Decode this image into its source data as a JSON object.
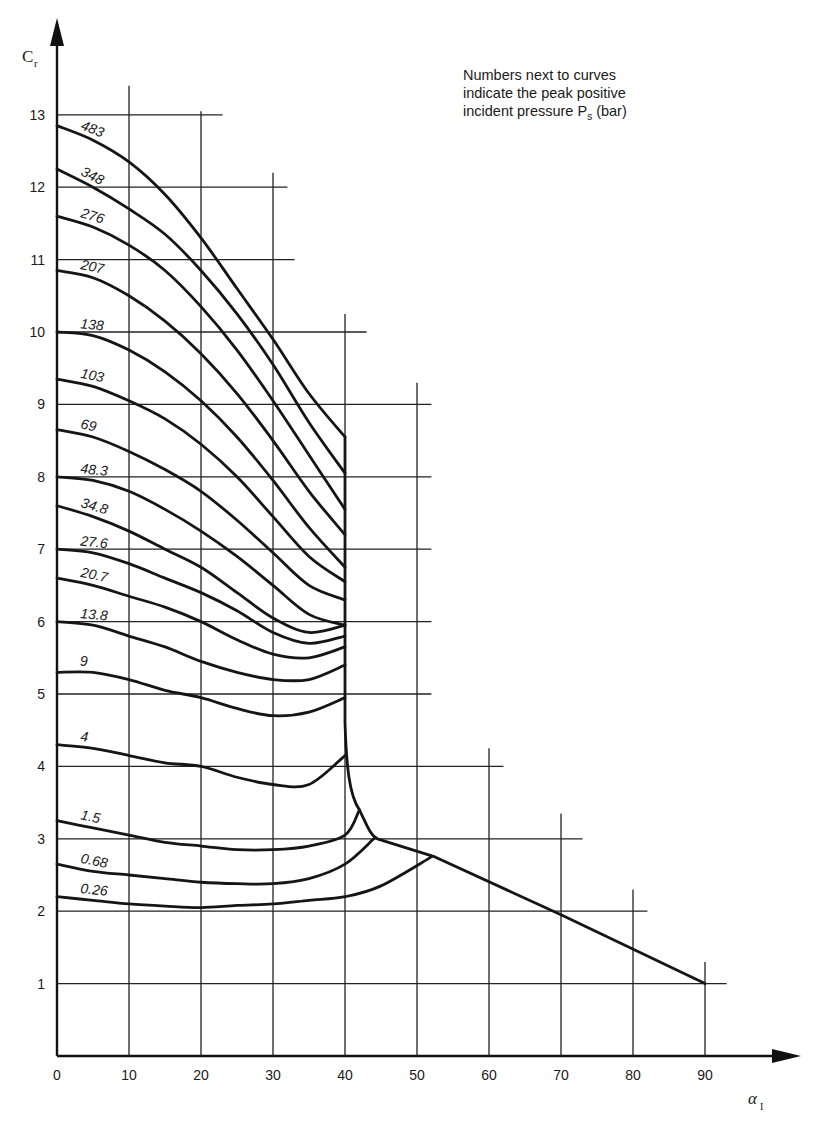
{
  "chart_data": {
    "type": "line",
    "title": "",
    "annotation": {
      "line1": "Numbers next to curves",
      "line2": "indicate the peak positive",
      "line3_prefix": "incident pressure P",
      "line3_sub": "s",
      "line3_suffix": " (bar)"
    },
    "xlabel": "α",
    "xlabel_sub": "I",
    "ylabel": "C",
    "ylabel_sub": "r",
    "xlim": [
      0,
      95
    ],
    "ylim": [
      0,
      13.6
    ],
    "x_ticks": [
      0,
      10,
      20,
      30,
      40,
      50,
      60,
      70,
      80,
      90
    ],
    "y_ticks": [
      1,
      2,
      3,
      4,
      5,
      6,
      7,
      8,
      9,
      10,
      11,
      12,
      13
    ],
    "grid": "staircase",
    "grid_extents": {
      "horizontal_right_end_x": {
        "1": 93,
        "2": 82,
        "3": 73,
        "4": 62,
        "5": 52,
        "6": 52,
        "7": 52,
        "8": 52,
        "9": 52,
        "10": 43,
        "11": 33,
        "12": 32,
        "13": 23
      },
      "vertical_top_y": {
        "10": 13.4,
        "20": 13.05,
        "30": 12.2,
        "40": 10.25,
        "50": 9.3,
        "60": 4.25,
        "70": 3.35,
        "80": 2.3,
        "90": 1.3
      }
    },
    "series": [
      {
        "name": "483",
        "points": [
          [
            0,
            12.85
          ],
          [
            5,
            12.65
          ],
          [
            10,
            12.35
          ],
          [
            15,
            11.9
          ],
          [
            20,
            11.3
          ],
          [
            25,
            10.6
          ],
          [
            30,
            9.9
          ],
          [
            35,
            9.15
          ],
          [
            40,
            8.55
          ]
        ]
      },
      {
        "name": "348",
        "points": [
          [
            0,
            12.25
          ],
          [
            5,
            12.0
          ],
          [
            10,
            11.7
          ],
          [
            15,
            11.35
          ],
          [
            20,
            10.85
          ],
          [
            25,
            10.25
          ],
          [
            30,
            9.55
          ],
          [
            35,
            8.75
          ],
          [
            40,
            8.05
          ]
        ]
      },
      {
        "name": "276",
        "points": [
          [
            0,
            11.6
          ],
          [
            5,
            11.45
          ],
          [
            10,
            11.2
          ],
          [
            15,
            10.85
          ],
          [
            20,
            10.35
          ],
          [
            25,
            9.75
          ],
          [
            30,
            9.05
          ],
          [
            35,
            8.3
          ],
          [
            40,
            7.55
          ]
        ]
      },
      {
        "name": "207",
        "points": [
          [
            0,
            10.85
          ],
          [
            5,
            10.75
          ],
          [
            10,
            10.5
          ],
          [
            15,
            10.15
          ],
          [
            20,
            9.7
          ],
          [
            25,
            9.15
          ],
          [
            30,
            8.5
          ],
          [
            35,
            7.8
          ],
          [
            40,
            7.2
          ]
        ]
      },
      {
        "name": "138",
        "points": [
          [
            0,
            10.0
          ],
          [
            5,
            9.95
          ],
          [
            10,
            9.75
          ],
          [
            15,
            9.45
          ],
          [
            20,
            9.05
          ],
          [
            25,
            8.55
          ],
          [
            30,
            7.95
          ],
          [
            35,
            7.3
          ],
          [
            40,
            6.75
          ]
        ]
      },
      {
        "name": "103",
        "points": [
          [
            0,
            9.35
          ],
          [
            5,
            9.25
          ],
          [
            10,
            9.05
          ],
          [
            15,
            8.8
          ],
          [
            20,
            8.45
          ],
          [
            25,
            8.0
          ],
          [
            30,
            7.45
          ],
          [
            35,
            6.9
          ],
          [
            40,
            6.55
          ]
        ]
      },
      {
        "name": "69",
        "points": [
          [
            0,
            8.65
          ],
          [
            5,
            8.55
          ],
          [
            10,
            8.35
          ],
          [
            15,
            8.1
          ],
          [
            20,
            7.8
          ],
          [
            25,
            7.4
          ],
          [
            30,
            6.95
          ],
          [
            35,
            6.5
          ],
          [
            40,
            6.3
          ]
        ]
      },
      {
        "name": "48.3",
        "points": [
          [
            0,
            8.0
          ],
          [
            5,
            7.95
          ],
          [
            10,
            7.8
          ],
          [
            15,
            7.55
          ],
          [
            20,
            7.25
          ],
          [
            25,
            6.9
          ],
          [
            30,
            6.5
          ],
          [
            35,
            6.1
          ],
          [
            40,
            5.95
          ]
        ]
      },
      {
        "name": "34.8",
        "points": [
          [
            0,
            7.6
          ],
          [
            5,
            7.45
          ],
          [
            10,
            7.25
          ],
          [
            15,
            7.0
          ],
          [
            20,
            6.75
          ],
          [
            25,
            6.4
          ],
          [
            30,
            6.05
          ],
          [
            35,
            5.85
          ],
          [
            40,
            5.95
          ]
        ]
      },
      {
        "name": "27.6",
        "points": [
          [
            0,
            7.0
          ],
          [
            5,
            6.95
          ],
          [
            10,
            6.8
          ],
          [
            15,
            6.6
          ],
          [
            20,
            6.4
          ],
          [
            25,
            6.15
          ],
          [
            30,
            5.85
          ],
          [
            35,
            5.7
          ],
          [
            40,
            5.8
          ]
        ]
      },
      {
        "name": "20.7",
        "points": [
          [
            0,
            6.6
          ],
          [
            5,
            6.5
          ],
          [
            10,
            6.35
          ],
          [
            15,
            6.2
          ],
          [
            20,
            6.0
          ],
          [
            25,
            5.75
          ],
          [
            30,
            5.55
          ],
          [
            35,
            5.5
          ],
          [
            40,
            5.65
          ]
        ]
      },
      {
        "name": "13.8",
        "points": [
          [
            0,
            6.0
          ],
          [
            5,
            5.95
          ],
          [
            10,
            5.8
          ],
          [
            15,
            5.65
          ],
          [
            20,
            5.45
          ],
          [
            25,
            5.3
          ],
          [
            30,
            5.2
          ],
          [
            35,
            5.2
          ],
          [
            40,
            5.4
          ]
        ]
      },
      {
        "name": "9",
        "points": [
          [
            0,
            5.3
          ],
          [
            5,
            5.3
          ],
          [
            10,
            5.2
          ],
          [
            15,
            5.05
          ],
          [
            20,
            4.95
          ],
          [
            25,
            4.8
          ],
          [
            30,
            4.7
          ],
          [
            35,
            4.75
          ],
          [
            40,
            4.95
          ]
        ]
      },
      {
        "name": "4",
        "points": [
          [
            0,
            4.3
          ],
          [
            5,
            4.25
          ],
          [
            10,
            4.15
          ],
          [
            15,
            4.05
          ],
          [
            20,
            4.0
          ],
          [
            25,
            3.85
          ],
          [
            30,
            3.75
          ],
          [
            35,
            3.75
          ],
          [
            40,
            4.15
          ]
        ]
      },
      {
        "name": "1.5",
        "points": [
          [
            0,
            3.25
          ],
          [
            5,
            3.15
          ],
          [
            10,
            3.05
          ],
          [
            15,
            2.95
          ],
          [
            20,
            2.9
          ],
          [
            25,
            2.85
          ],
          [
            30,
            2.85
          ],
          [
            35,
            2.9
          ],
          [
            40,
            3.05
          ],
          [
            42,
            3.4
          ]
        ]
      },
      {
        "name": "0.68",
        "points": [
          [
            0,
            2.65
          ],
          [
            5,
            2.55
          ],
          [
            10,
            2.5
          ],
          [
            15,
            2.45
          ],
          [
            20,
            2.4
          ],
          [
            25,
            2.38
          ],
          [
            30,
            2.38
          ],
          [
            35,
            2.45
          ],
          [
            40,
            2.65
          ],
          [
            44,
            3.0
          ]
        ]
      },
      {
        "name": "0.26",
        "points": [
          [
            0,
            2.2
          ],
          [
            5,
            2.15
          ],
          [
            10,
            2.1
          ],
          [
            15,
            2.07
          ],
          [
            20,
            2.05
          ],
          [
            25,
            2.08
          ],
          [
            30,
            2.1
          ],
          [
            35,
            2.15
          ],
          [
            40,
            2.2
          ],
          [
            45,
            2.35
          ],
          [
            52,
            2.75
          ]
        ]
      }
    ],
    "envelope": {
      "name": "limit line",
      "points": [
        [
          40,
          8.55
        ],
        [
          40,
          6.0
        ],
        [
          40,
          4.6
        ],
        [
          40.5,
          3.7
        ],
        [
          42,
          3.4
        ],
        [
          44.5,
          3.0
        ],
        [
          52.5,
          2.75
        ],
        [
          70,
          1.95
        ],
        [
          90,
          1.0
        ]
      ]
    }
  }
}
